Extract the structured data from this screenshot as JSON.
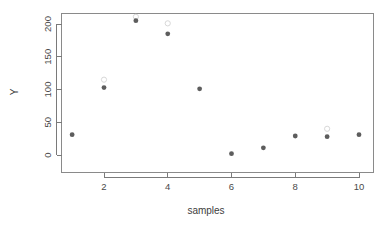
{
  "chart_data": {
    "type": "scatter",
    "title": "",
    "xlabel": "samples",
    "ylabel": "Y",
    "xlim": [
      0.6,
      10.5
    ],
    "ylim": [
      -8,
      218
    ],
    "grid": false,
    "legend": null,
    "x_ticks": [
      2,
      4,
      6,
      8,
      10
    ],
    "y_ticks": [
      0,
      50,
      100,
      150,
      200
    ],
    "x_tick_labels": [
      "2",
      "4",
      "6",
      "8",
      "10"
    ],
    "y_tick_labels": [
      "0",
      "50",
      "100",
      "150",
      "200"
    ],
    "series": [
      {
        "name": "observed",
        "marker": "filled-circle",
        "color": "#5d5d5d",
        "x": [
          1,
          2,
          3,
          4,
          5,
          6,
          7,
          8,
          9,
          10
        ],
        "values": [
          31,
          103,
          205,
          185,
          101,
          2,
          11,
          29,
          28,
          31
        ]
      },
      {
        "name": "secondary",
        "marker": "open-circle",
        "color": "#d8d8d8",
        "x": [
          2,
          3,
          4,
          9
        ],
        "values": [
          115,
          211,
          201,
          40
        ]
      }
    ]
  },
  "axes": {
    "x_axis_title": "samples",
    "y_axis_title": "Y"
  },
  "figure": {
    "background": "#ffffff",
    "frame_color": "#8a8a8a",
    "axis_color": "#7a7a7a",
    "point_color": "#5d5d5d",
    "open_point_color": "#d8d8d8"
  }
}
